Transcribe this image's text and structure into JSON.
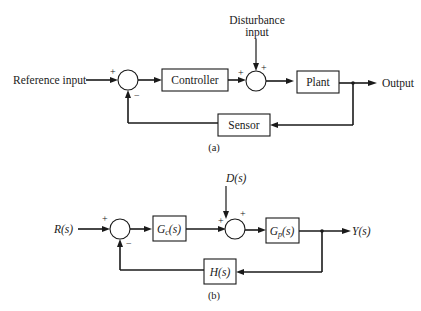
{
  "diagram_a": {
    "caption": "(a)",
    "reference_input": "Reference input",
    "controller": "Controller",
    "plant": "Plant",
    "sensor": "Sensor",
    "output": "Output",
    "disturbance_line1": "Disturbance",
    "disturbance_line2": "input",
    "sum1_plus": "+",
    "sum1_minus": "−",
    "sum2_plus_left": "+",
    "sum2_plus_top": "+"
  },
  "diagram_b": {
    "caption": "(b)",
    "input": "R(s)",
    "controller_G": "G",
    "controller_sub": "c",
    "controller_arg": "(s)",
    "plant_G": "G",
    "plant_sub": "p",
    "plant_arg": "(s)",
    "sensor": "H(s)",
    "output": "Y(s)",
    "disturbance": "D(s)",
    "sum1_plus": "+",
    "sum1_minus": "−",
    "sum2_plus_left": "+",
    "sum2_plus_top": "+"
  }
}
